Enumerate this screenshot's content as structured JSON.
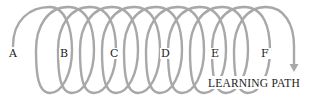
{
  "diagram": {
    "type": "spiral-learning-path",
    "stages": [
      {
        "label": "A",
        "x": 13,
        "y": 56
      },
      {
        "label": "B",
        "x": 64,
        "y": 56
      },
      {
        "label": "C",
        "x": 114,
        "y": 56
      },
      {
        "label": "D",
        "x": 165,
        "y": 56
      },
      {
        "label": "E",
        "x": 215,
        "y": 56
      },
      {
        "label": "F",
        "x": 265,
        "y": 56
      }
    ],
    "path_label": "LEARNING PATH",
    "colors": {
      "spiral": "#a8a8a8",
      "text": "#222222",
      "background": "#ffffff"
    }
  }
}
